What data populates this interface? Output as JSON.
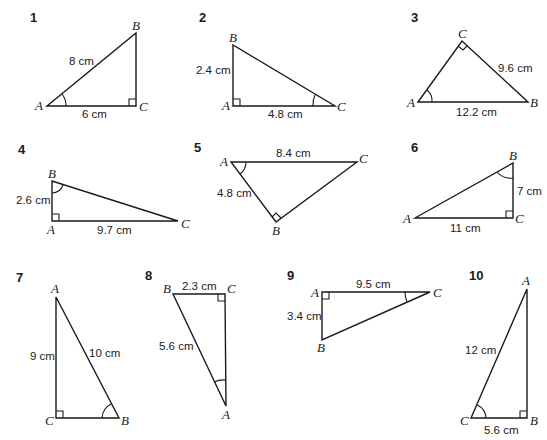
{
  "diagram": {
    "triangles": [
      {
        "number": "1",
        "vertices": {
          "A": [
            47,
            106
          ],
          "B": [
            136,
            33
          ],
          "C": [
            136,
            106
          ]
        },
        "right_angle_at": "C",
        "marked_angle_at": "A",
        "sides": [
          {
            "between": "AB",
            "label": "8 cm"
          },
          {
            "between": "AC",
            "label": "6 cm"
          }
        ]
      },
      {
        "number": "2",
        "vertices": {
          "A": [
            233,
            106
          ],
          "B": [
            233,
            45
          ],
          "C": [
            335,
            106
          ]
        },
        "right_angle_at": "A",
        "marked_angle_at": "C",
        "sides": [
          {
            "between": "AB",
            "label": "2.4 cm"
          },
          {
            "between": "AC",
            "label": "4.8 cm"
          }
        ]
      },
      {
        "number": "3",
        "vertices": {
          "A": [
            418,
            102
          ],
          "B": [
            528,
            102
          ],
          "C": [
            462,
            41
          ]
        },
        "right_angle_at": "C",
        "marked_angle_at": "A",
        "sides": [
          {
            "between": "CB",
            "label": "9.6 cm"
          },
          {
            "between": "AB",
            "label": "12.2 cm"
          }
        ]
      },
      {
        "number": "4",
        "vertices": {
          "A": [
            52,
            221
          ],
          "B": [
            52,
            181
          ],
          "C": [
            178,
            221
          ]
        },
        "right_angle_at": "A",
        "marked_angle_at": "B",
        "sides": [
          {
            "between": "AB",
            "label": "2.6 cm"
          },
          {
            "between": "AC",
            "label": "9.7 cm"
          }
        ]
      },
      {
        "number": "5",
        "vertices": {
          "A": [
            231,
            162
          ],
          "B": [
            276,
            222
          ],
          "C": [
            357,
            162
          ]
        },
        "right_angle_at": "B",
        "marked_angle_at": "A",
        "sides": [
          {
            "between": "AC",
            "label": "8.4 cm"
          },
          {
            "between": "AB",
            "label": "4.8 cm"
          }
        ]
      },
      {
        "number": "6",
        "vertices": {
          "A": [
            415,
            218
          ],
          "B": [
            513,
            163
          ],
          "C": [
            513,
            218
          ]
        },
        "right_angle_at": "C",
        "marked_angle_at": "B",
        "sides": [
          {
            "between": "BC",
            "label": "7 cm"
          },
          {
            "between": "AC",
            "label": "11 cm"
          }
        ]
      },
      {
        "number": "7",
        "vertices": {
          "A": [
            56,
            297
          ],
          "B": [
            119,
            418
          ],
          "C": [
            56,
            418
          ]
        },
        "right_angle_at": "C",
        "marked_angle_at": "B",
        "sides": [
          {
            "between": "AC",
            "label": "9 cm"
          },
          {
            "between": "AB",
            "label": "10 cm"
          }
        ]
      },
      {
        "number": "8",
        "vertices": {
          "A": [
            226,
            406
          ],
          "B": [
            173,
            294
          ],
          "C": [
            225,
            294
          ]
        },
        "right_angle_at": "C",
        "marked_angle_at": "A",
        "sides": [
          {
            "between": "BC",
            "label": "2.3 cm"
          },
          {
            "between": "AB",
            "label": "5.6 cm"
          }
        ]
      },
      {
        "number": "9",
        "vertices": {
          "A": [
            322,
            292
          ],
          "B": [
            322,
            340
          ],
          "C": [
            430,
            292
          ]
        },
        "right_angle_at": "A",
        "marked_angle_at": "C",
        "sides": [
          {
            "between": "AC",
            "label": "9.5 cm"
          },
          {
            "between": "AB",
            "label": "3.4 cm"
          }
        ]
      },
      {
        "number": "10",
        "vertices": {
          "A": [
            527,
            289
          ],
          "B": [
            527,
            418
          ],
          "C": [
            471,
            418
          ]
        },
        "right_angle_at": "B",
        "marked_angle_at": "C",
        "sides": [
          {
            "between": "AC",
            "label": "12 cm"
          },
          {
            "between": "CB",
            "label": "5.6 cm"
          }
        ]
      }
    ]
  }
}
